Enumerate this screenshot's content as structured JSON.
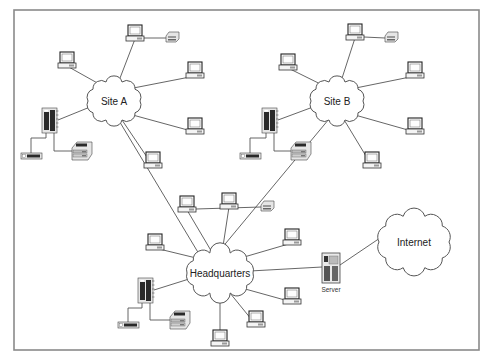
{
  "diagram": {
    "frame": {
      "x": 14,
      "y": 10,
      "w": 465,
      "h": 340
    },
    "clouds": [
      {
        "id": "site-a",
        "label": "Site A",
        "cx": 114,
        "cy": 101,
        "rx": 26,
        "ry": 20
      },
      {
        "id": "site-b",
        "label": "Site B",
        "cx": 337,
        "cy": 101,
        "rx": 26,
        "ry": 20
      },
      {
        "id": "headquarters",
        "label": "Headquarters",
        "cx": 220,
        "cy": 273,
        "rx": 33,
        "ry": 21
      },
      {
        "id": "internet",
        "label": "Internet",
        "cx": 414,
        "cy": 242,
        "rx": 35,
        "ry": 27
      }
    ],
    "server": {
      "label": "Server",
      "x": 322,
      "y": 253
    },
    "sites": [
      {
        "name": "Site A",
        "pcs": [
          {
            "x": 67,
            "y": 52
          },
          {
            "x": 135,
            "y": 25
          },
          {
            "x": 195,
            "y": 62
          },
          {
            "x": 195,
            "y": 118
          },
          {
            "x": 153,
            "y": 152
          }
        ],
        "printer_small": {
          "x": 166,
          "y": 32
        },
        "tower": {
          "x": 42,
          "y": 108
        },
        "modem": {
          "x": 21,
          "y": 153
        },
        "laser_printer": {
          "x": 72,
          "y": 142
        }
      },
      {
        "name": "Site B",
        "pcs": [
          {
            "x": 288,
            "y": 54
          },
          {
            "x": 355,
            "y": 24
          },
          {
            "x": 415,
            "y": 62
          },
          {
            "x": 415,
            "y": 118
          },
          {
            "x": 372,
            "y": 152
          }
        ],
        "printer_small": {
          "x": 385,
          "y": 32
        },
        "tower": {
          "x": 262,
          "y": 108
        },
        "modem": {
          "x": 240,
          "y": 153
        },
        "laser_printer": {
          "x": 291,
          "y": 142
        }
      },
      {
        "name": "Headquarters",
        "pcs": [
          {
            "x": 155,
            "y": 234
          },
          {
            "x": 187,
            "y": 196
          },
          {
            "x": 229,
            "y": 193
          },
          {
            "x": 292,
            "y": 229
          },
          {
            "x": 292,
            "y": 288
          },
          {
            "x": 256,
            "y": 311
          },
          {
            "x": 220,
            "y": 330
          }
        ],
        "printer_small": {
          "x": 261,
          "y": 201
        },
        "tower": {
          "x": 138,
          "y": 278
        },
        "modem": {
          "x": 118,
          "y": 322
        },
        "laser_printer": {
          "x": 170,
          "y": 311
        }
      }
    ]
  }
}
